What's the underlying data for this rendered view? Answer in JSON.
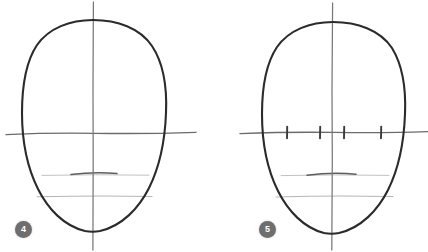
{
  "page": {
    "background_color": "#ffffff",
    "width": 428,
    "height": 252
  },
  "style": {
    "outline_color": "#2b2b2b",
    "guideline_color": "#6f6f6f",
    "faint_guideline_color": "#b8b8b8",
    "badge_color": "#6e6e6e",
    "badge_text_color": "#ffffff"
  },
  "steps": [
    {
      "id": "step-4",
      "badge_label": "4",
      "badge_position": {
        "x": 15,
        "y": 221
      },
      "head": {
        "center_x": 93,
        "top_y": 20,
        "chin_y": 232,
        "left_x": 22,
        "right_x": 166
      },
      "guidelines": [
        {
          "name": "vertical-center-line",
          "orientation": "vertical",
          "x": 93,
          "y1": 2,
          "y2": 250
        },
        {
          "name": "eye-line",
          "orientation": "horizontal",
          "y": 133,
          "x1": 6,
          "x2": 196
        },
        {
          "name": "nose-line",
          "orientation": "horizontal",
          "y": 175,
          "x1": 42,
          "x2": 148
        },
        {
          "name": "mouth-line",
          "orientation": "horizontal",
          "y": 173,
          "x1": 72,
          "x2": 116
        },
        {
          "name": "lip-line",
          "orientation": "horizontal",
          "y": 196,
          "x1": 37,
          "x2": 152
        }
      ],
      "tick_marks": []
    },
    {
      "id": "step-5",
      "badge_label": "5",
      "badge_position": {
        "x": 259,
        "y": 221
      },
      "head": {
        "center_x": 332,
        "top_y": 22,
        "chin_y": 234,
        "left_x": 262,
        "right_x": 405
      },
      "guidelines": [
        {
          "name": "vertical-center-line",
          "orientation": "vertical",
          "x": 332,
          "y1": 3,
          "y2": 250
        },
        {
          "name": "eye-line",
          "orientation": "horizontal",
          "y": 132,
          "x1": 240,
          "x2": 428
        },
        {
          "name": "nose-line",
          "orientation": "horizontal",
          "y": 175,
          "x1": 282,
          "x2": 388
        },
        {
          "name": "mouth-line",
          "orientation": "horizontal",
          "y": 174,
          "x1": 308,
          "x2": 355
        },
        {
          "name": "lip-line",
          "orientation": "horizontal",
          "y": 196,
          "x1": 276,
          "x2": 393
        }
      ],
      "tick_marks": [
        {
          "name": "eye-division-tick-1",
          "x": 287,
          "y1": 127,
          "y2": 138
        },
        {
          "name": "eye-division-tick-2",
          "x": 320,
          "y1": 127,
          "y2": 138
        },
        {
          "name": "eye-division-tick-3",
          "x": 344,
          "y1": 127,
          "y2": 138
        },
        {
          "name": "eye-division-tick-4",
          "x": 381,
          "y1": 127,
          "y2": 138
        }
      ]
    }
  ]
}
